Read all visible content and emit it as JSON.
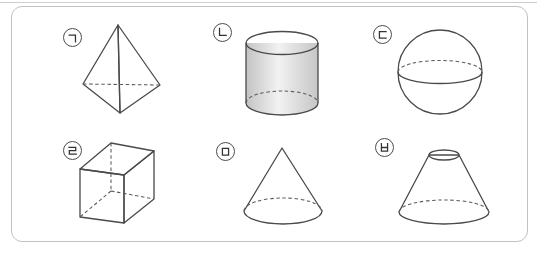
{
  "figure": {
    "description_name": "solid-figures-grid",
    "frame_border_color": "#c2c2c2",
    "top_rule_color": "#cfcfcf",
    "background": "#ffffff"
  },
  "shapes": [
    {
      "label": "ㄱ",
      "name": "triangular-pyramid"
    },
    {
      "label": "ㄴ",
      "name": "cylinder"
    },
    {
      "label": "ㄷ",
      "name": "sphere"
    },
    {
      "label": "ㄹ",
      "name": "cube"
    },
    {
      "label": "ㅁ",
      "name": "cone"
    },
    {
      "label": "ㅂ",
      "name": "truncated-cone"
    }
  ],
  "colors": {
    "solid_edge": "#4a4a4a",
    "hidden_edge": "#5a5a5a",
    "fill_lightest": "#ececec",
    "fill_light": "#e8e8e8",
    "fill_mid": "#d8d8d8",
    "fill_dark": "#c2c2c2",
    "label_circle_border": "#4d4d4d",
    "label_glyph": "#333333"
  }
}
